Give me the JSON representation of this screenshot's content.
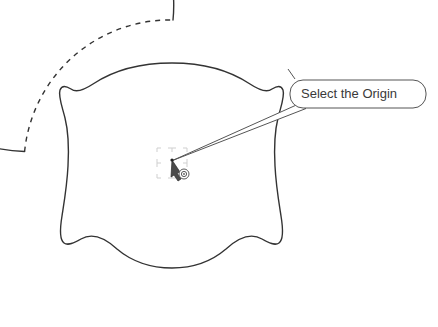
{
  "viewport": {
    "width": 438,
    "height": 327,
    "background_color": "#ffffff"
  },
  "drawing": {
    "title": "CAD sketch viewport with origin selection prompt",
    "stroke_color": "#333333",
    "accent_color": "#3a3a3a",
    "guide_color": "#c8c8c8",
    "entities": [
      {
        "name": "outer-circle",
        "type": "circle",
        "style": "mixed-solid-dashed",
        "center_x": 170,
        "center_y": 166,
        "radius": 146,
        "label": "Outer boundary circle"
      },
      {
        "name": "construction-arc",
        "type": "arc",
        "style": "dashed",
        "label": "Dashed construction arc (upper-left quadrant)"
      },
      {
        "name": "organic-profile",
        "type": "closed-spline",
        "style": "solid",
        "label": "Lobed profile sketch"
      },
      {
        "name": "origin-point",
        "type": "point",
        "x": 172,
        "y": 160,
        "label": "Sketch origin"
      }
    ]
  },
  "snap_marker": {
    "name": "grid-snap-marker",
    "label": "Origin snap grid indicator",
    "color": "#cccccc",
    "cell_count": 4
  },
  "cursor": {
    "name": "arrow-cursor",
    "label": "Arrow pointer",
    "x": 172,
    "y": 160,
    "glyph_label": "concentric-circle-origin-glyph"
  },
  "callout": {
    "name": "origin-tooltip",
    "text": "Select the Origin",
    "box": {
      "x": 290,
      "y": 80,
      "width": 136,
      "height": 28,
      "radius": 13
    },
    "fill_color": "#ffffff",
    "border_color": "#555555",
    "text_color": "#3a3a3a",
    "tail_target_x": 172,
    "tail_target_y": 160
  }
}
